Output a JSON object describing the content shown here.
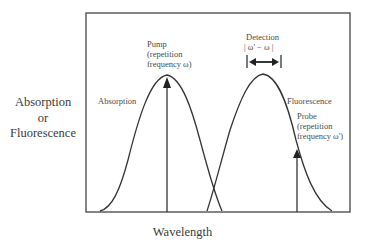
{
  "axes": {
    "y_label_lines": [
      "Absorption",
      "or",
      "Fluorescence"
    ],
    "x_label": "Wavelength"
  },
  "curves": {
    "absorption": {
      "label": "Absorption",
      "peak_x": 167,
      "peak_y": 75,
      "start_x": 100,
      "end_x": 222
    },
    "fluorescence": {
      "label": "Fluorescence",
      "peak_x": 263,
      "peak_y": 74,
      "start_x": 207,
      "end_x": 332
    }
  },
  "annotations": {
    "pump": {
      "lines": [
        "Pump",
        "(repetition",
        "frequency   ω)"
      ]
    },
    "probe": {
      "lines": [
        "Probe",
        "(repetition",
        "frequency  ω')"
      ]
    },
    "detection": {
      "title": "Detection",
      "formula": "| ω' − ω   |"
    }
  },
  "colors": {
    "line": "#333333",
    "text": "#444444",
    "background": "#ffffff"
  }
}
